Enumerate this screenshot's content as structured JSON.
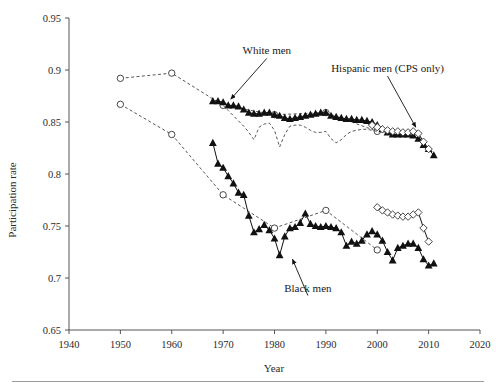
{
  "figure": {
    "background": "#ffffff",
    "ink": "#111111"
  },
  "chart_data": {
    "type": "line",
    "title": "",
    "xlabel": "Year",
    "ylabel": "Participation rate",
    "xlim": [
      1940,
      2020
    ],
    "ylim": [
      0.65,
      0.95
    ],
    "xticks": [
      1940,
      1950,
      1960,
      1970,
      1980,
      1990,
      2000,
      2010,
      2020
    ],
    "xtick_labels": [
      "1940",
      "1950",
      "1960",
      "1970",
      "1980",
      "1990",
      "2000",
      "2010",
      "2020"
    ],
    "yticks": [
      0.65,
      0.7,
      0.75,
      0.8,
      0.85,
      0.9,
      0.95
    ],
    "ytick_labels": [
      "0.65",
      "0.7",
      "0.75",
      "0.8",
      "0.85",
      "0.9",
      "0.95"
    ],
    "grid": false,
    "legend_position": "none",
    "annotations": [
      {
        "text": "White men",
        "x": 1978.5,
        "y": 0.915,
        "arrow_to_x": 1971.5,
        "arrow_to_y": 0.872
      },
      {
        "text": "Hispanic men (CPS only)",
        "x": 2002.0,
        "y": 0.898,
        "arrow_to_x": 2007.5,
        "arrow_to_y": 0.845
      },
      {
        "text": "Black men",
        "x": 1986.5,
        "y": 0.687,
        "arrow_to_x": 1983.5,
        "arrow_to_y": 0.718
      }
    ],
    "series": [
      {
        "name": "White men (census)",
        "marker": "circle",
        "line": "dashed",
        "x": [
          1950,
          1960,
          1970,
          1980,
          1990,
          2000
        ],
        "values": [
          0.892,
          0.897,
          0.866,
          0.857,
          0.859,
          0.841
        ]
      },
      {
        "name": "White men (CPS)",
        "marker": "triangle",
        "line": "solid",
        "x": [
          1968,
          1969,
          1970,
          1971,
          1972,
          1973,
          1974,
          1975,
          1976,
          1977,
          1978,
          1979,
          1980,
          1981,
          1982,
          1983,
          1984,
          1985,
          1986,
          1987,
          1988,
          1989,
          1990,
          1991,
          1992,
          1993,
          1994,
          1995,
          1996,
          1997,
          1998,
          1999,
          2000,
          2001,
          2002,
          2003,
          2004,
          2005,
          2006,
          2007,
          2008,
          2009,
          2010,
          2011
        ],
        "values": [
          0.87,
          0.87,
          0.869,
          0.866,
          0.866,
          0.865,
          0.862,
          0.859,
          0.858,
          0.858,
          0.859,
          0.859,
          0.857,
          0.856,
          0.854,
          0.853,
          0.854,
          0.855,
          0.856,
          0.857,
          0.858,
          0.859,
          0.859,
          0.856,
          0.855,
          0.854,
          0.853,
          0.853,
          0.852,
          0.852,
          0.851,
          0.85,
          0.847,
          0.843,
          0.84,
          0.838,
          0.838,
          0.838,
          0.838,
          0.837,
          0.834,
          0.828,
          0.824,
          0.818
        ]
      },
      {
        "name": "White men (alternate, dashed)",
        "marker": "none",
        "line": "dashed",
        "x": [
          1970,
          1971,
          1972,
          1973,
          1974,
          1975,
          1976,
          1977,
          1978,
          1979,
          1980,
          1981,
          1982,
          1983,
          1984,
          1985,
          1986,
          1987,
          1988,
          1989,
          1990,
          1991,
          1992,
          1993,
          1994,
          1995,
          1996,
          1997,
          1998,
          1999,
          2000
        ],
        "values": [
          0.866,
          0.861,
          0.856,
          0.851,
          0.846,
          0.84,
          0.833,
          0.845,
          0.848,
          0.849,
          0.842,
          0.826,
          0.838,
          0.846,
          0.847,
          0.847,
          0.845,
          0.842,
          0.84,
          0.84,
          0.841,
          0.834,
          0.83,
          0.833,
          0.838,
          0.841,
          0.842,
          0.843,
          0.843,
          0.842,
          0.841
        ]
      },
      {
        "name": "Black men (census)",
        "marker": "circle",
        "line": "dashed",
        "x": [
          1950,
          1960,
          1970,
          1980,
          1990,
          2000
        ],
        "values": [
          0.867,
          0.838,
          0.78,
          0.748,
          0.765,
          0.727
        ]
      },
      {
        "name": "Black men (CPS)",
        "marker": "triangle",
        "line": "solid",
        "x": [
          1968,
          1969,
          1970,
          1971,
          1972,
          1973,
          1974,
          1975,
          1976,
          1977,
          1978,
          1979,
          1980,
          1981,
          1982,
          1983,
          1984,
          1985,
          1986,
          1987,
          1988,
          1989,
          1990,
          1991,
          1992,
          1993,
          1994,
          1995,
          1996,
          1997,
          1998,
          1999,
          2000,
          2001,
          2002,
          2003,
          2004,
          2005,
          2006,
          2007,
          2008,
          2009,
          2010,
          2011
        ],
        "values": [
          0.83,
          0.81,
          0.806,
          0.798,
          0.791,
          0.782,
          0.78,
          0.76,
          0.744,
          0.747,
          0.751,
          0.746,
          0.738,
          0.722,
          0.74,
          0.748,
          0.749,
          0.753,
          0.762,
          0.752,
          0.75,
          0.749,
          0.75,
          0.749,
          0.748,
          0.744,
          0.731,
          0.735,
          0.733,
          0.736,
          0.742,
          0.745,
          0.742,
          0.736,
          0.725,
          0.717,
          0.729,
          0.731,
          0.733,
          0.733,
          0.729,
          0.718,
          0.712,
          0.714
        ]
      },
      {
        "name": "Hispanic men upper (CPS only)",
        "marker": "diamond",
        "line": "solid",
        "x": [
          1999,
          2000,
          2001,
          2002,
          2003,
          2004,
          2005,
          2006,
          2007,
          2008,
          2009,
          2010
        ],
        "values": [
          0.847,
          0.845,
          0.843,
          0.842,
          0.841,
          0.841,
          0.84,
          0.84,
          0.841,
          0.839,
          0.831,
          0.824
        ]
      },
      {
        "name": "Hispanic men lower (CPS only)",
        "marker": "diamond",
        "line": "solid",
        "x": [
          2000,
          2001,
          2002,
          2003,
          2004,
          2005,
          2006,
          2007,
          2008,
          2009,
          2010
        ],
        "values": [
          0.768,
          0.765,
          0.763,
          0.761,
          0.76,
          0.759,
          0.759,
          0.761,
          0.763,
          0.748,
          0.735
        ]
      }
    ]
  }
}
